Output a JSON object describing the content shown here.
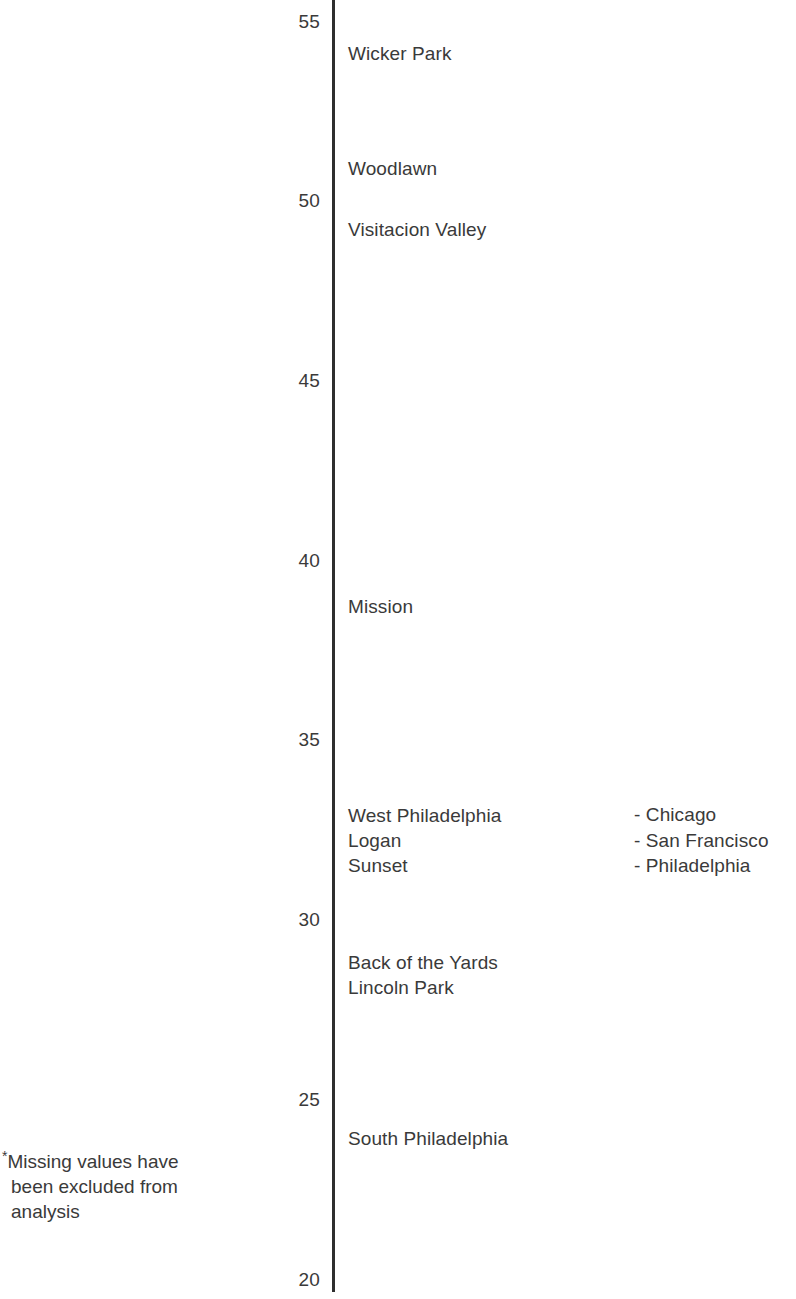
{
  "chart_data": {
    "type": "scatter",
    "title": "",
    "subtitle": "",
    "xlabel": "",
    "ylabel": "",
    "grid": false,
    "orientation": "vertical-axis-with-text-labels",
    "ylim": [
      20,
      55
    ],
    "yticks": [
      20,
      25,
      30,
      35,
      40,
      45,
      50,
      55
    ],
    "ytick_labels": [
      "20",
      "25",
      "30",
      "35",
      "40",
      "45",
      "50",
      "55"
    ],
    "categories": [
      "Wicker Park",
      "Woodlawn",
      "Visitacion Valley",
      "Mission",
      "West Philadelphia",
      "Logan",
      "Sunset",
      "Back of the Yards",
      "Lincoln Park",
      "South Philadelphia"
    ],
    "values": [
      54.1,
      50.9,
      49.2,
      38.7,
      32.9,
      32.2,
      31.5,
      28.8,
      28.1,
      23.9
    ],
    "points": [
      {
        "label": "Wicker Park",
        "value": 54.1,
        "city": "Chicago"
      },
      {
        "label": "Woodlawn",
        "value": 50.9,
        "city": "Chicago"
      },
      {
        "label": "Visitacion Valley",
        "value": 49.2,
        "city": "San Francisco"
      },
      {
        "label": "Mission",
        "value": 38.7,
        "city": "San Francisco"
      },
      {
        "label": "West Philadelphia",
        "value": 32.9,
        "city": "Philadelphia"
      },
      {
        "label": "Logan",
        "value": 32.2,
        "city": "Philadelphia"
      },
      {
        "label": "Sunset",
        "value": 31.5,
        "city": "San Francisco"
      },
      {
        "label": "Back of the Yards",
        "value": 28.8,
        "city": "Chicago"
      },
      {
        "label": "Lincoln Park",
        "value": 28.1,
        "city": "Chicago"
      },
      {
        "label": "South Philadelphia",
        "value": 23.9,
        "city": "Philadelphia"
      }
    ],
    "legend": {
      "position": "right",
      "entries": [
        {
          "label": "- Chicago"
        },
        {
          "label": "- San Francisco"
        },
        {
          "label": "- Philadelphia"
        }
      ]
    },
    "annotations": [
      {
        "name": "footnote",
        "text": "*Missing values have been excluded from analysis"
      }
    ]
  },
  "footnote": {
    "marker": "*",
    "line1": "Missing values have",
    "line2": "been excluded from",
    "line3": "analysis"
  },
  "colors": {
    "axis": "#2e2e2e",
    "text": "#3a3a3a",
    "background": "#ffffff"
  }
}
